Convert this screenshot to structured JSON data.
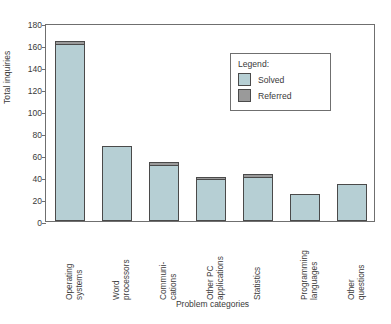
{
  "chart_data": {
    "type": "bar",
    "title": "",
    "subtitle": "",
    "xlabel": "Problem categories",
    "ylabel": "Total inquiries",
    "ylim": [
      0,
      180
    ],
    "ytick_step": 20,
    "yticks": [
      0,
      20,
      40,
      60,
      80,
      100,
      120,
      140,
      160,
      180
    ],
    "grid": false,
    "stacked": true,
    "legend": {
      "title": "Legend:",
      "position": "inside-top-right",
      "entries": [
        {
          "name": "Solved",
          "color": "#b6cfd4"
        },
        {
          "name": "Referred",
          "color": "#9a9a9a"
        }
      ]
    },
    "categories": [
      "Operating systems",
      "Word processors",
      "Communi- cations",
      "Other PC applications",
      "Statistics",
      "Programming languages",
      "Other questions"
    ],
    "category_lines": [
      "Operating\nsystems",
      "Word\nprocessors",
      "Communi-\ncations",
      "Other PC\napplications",
      "Statistics",
      "Programming\nlanguages",
      "Other\nquestions"
    ],
    "series": [
      {
        "name": "Solved",
        "values": [
          161,
          68,
          51,
          39,
          40,
          25,
          34
        ]
      },
      {
        "name": "Referred",
        "values": [
          3,
          0,
          3,
          1,
          3,
          0,
          0
        ]
      }
    ],
    "totals": [
      164,
      68,
      54,
      40,
      43,
      25,
      34
    ]
  },
  "colors": {
    "solved": "#b6cfd4",
    "referred": "#9a9a9a",
    "axis": "#6f6f6f",
    "bar_outline": "#4a4a4a",
    "text": "#3a3a3a",
    "background": "#ffffff"
  }
}
